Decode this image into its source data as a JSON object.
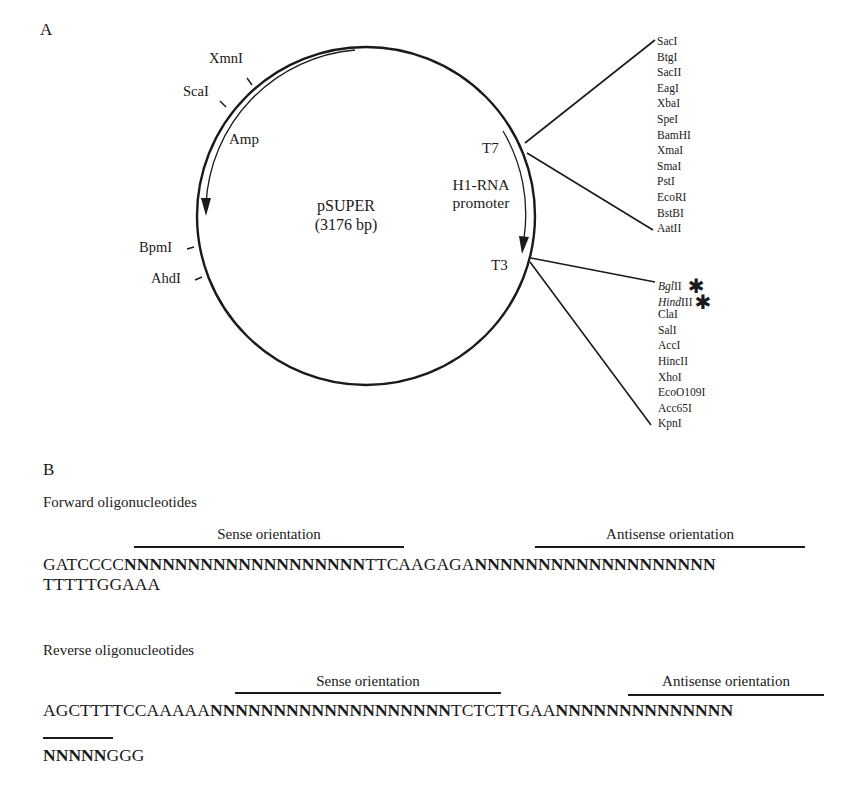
{
  "panel_a": {
    "label": "A",
    "plasmid": {
      "name": "pSUPER",
      "size": "(3176 bp)"
    },
    "backbone_sites": {
      "xmni": "XmnI",
      "scai": "ScaI",
      "bpmi": "BpmI",
      "ahdi": "AhdI"
    },
    "features": {
      "amp": "Amp",
      "promoter_line1": "H1-RNA",
      "promoter_line2": "promoter",
      "t7": "T7",
      "t3": "T3"
    },
    "mcs_upper": [
      "SacI",
      "BtgI",
      "SacII",
      "EagI",
      "XbaI",
      "SpeI",
      "BamHI",
      "XmaI",
      "SmaI",
      "PstI",
      "EcoRI",
      "BstBI",
      "AatII"
    ],
    "mcs_lower": {
      "bglii_italic": "Bgl",
      "bglii_roman": "II",
      "hindiii_italic": "Hind",
      "hindiii_roman": "III",
      "star": "✱",
      "rest": [
        "ClaI",
        "SalI",
        "AccI",
        "HincII",
        "XhoI",
        "EcoO109I",
        "Acc65I",
        "KpnI"
      ]
    }
  },
  "panel_b": {
    "label": "B",
    "forward": {
      "heading": "Forward oligonucleotides",
      "sense_label": "Sense orientation",
      "antisense_label": "Antisense orientation",
      "line1": {
        "prefix": "GATCCCC",
        "sense_n": "NNNNNNNNNNNNNNNNNNN",
        "loop": "TTCAAGAGA",
        "antisense_n": "NNNNNNNNNNNNNNNNNNN"
      },
      "line2": "TTTTTGGAAA"
    },
    "reverse": {
      "heading": "Reverse oligonucleotides",
      "sense_label": "Sense orientation",
      "antisense_label": "Antisense orientation",
      "line1": {
        "prefix": "AGCTTTTCCAAAAA",
        "sense_n": "NNNNNNNNNNNNNNNNNNN",
        "loop": "TCTCTTGAA",
        "antisense_n": "NNNNNNNNNNNNNN"
      },
      "line2": {
        "antisense_n": "NNNNN",
        "suffix": "GGG"
      }
    }
  }
}
